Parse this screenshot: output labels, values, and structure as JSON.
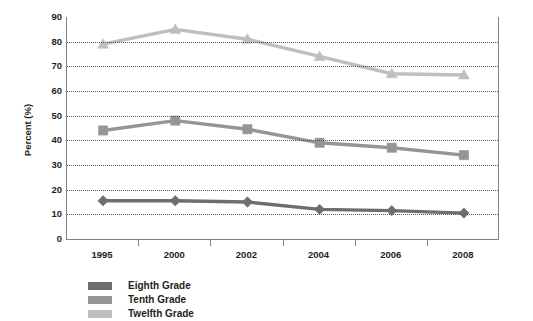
{
  "chart_data": {
    "type": "line",
    "title": "",
    "xlabel": "",
    "ylabel": "Percent (%)",
    "categories": [
      "1995",
      "2000",
      "2002",
      "2004",
      "2006",
      "2008"
    ],
    "ylim": [
      0,
      90
    ],
    "ytick_step": 10,
    "yticks": [
      "90",
      "80",
      "70",
      "60",
      "50",
      "40",
      "30",
      "20",
      "10",
      "0"
    ],
    "grid": true,
    "legend_position": "bottom-left",
    "series": [
      {
        "name": "Eighth Grade",
        "color": "#6d6e71",
        "marker": "diamond",
        "values": [
          15.5,
          15.5,
          15.0,
          12.0,
          11.5,
          10.5
        ]
      },
      {
        "name": "Tenth Grade",
        "color": "#939598",
        "marker": "square",
        "values": [
          44.0,
          48.0,
          44.5,
          39.0,
          37.0,
          34.0
        ]
      },
      {
        "name": "Twelfth Grade",
        "color": "#bcbec0",
        "marker": "triangle",
        "values": [
          79.0,
          85.0,
          81.0,
          74.0,
          67.0,
          66.5
        ]
      }
    ]
  },
  "axis": {
    "y_title": "Percent (%)"
  },
  "legend": {
    "items": [
      {
        "label": "Eighth Grade",
        "color": "#6d6e71"
      },
      {
        "label": "Tenth Grade",
        "color": "#939598"
      },
      {
        "label": "Twelfth Grade",
        "color": "#bcbec0"
      }
    ]
  }
}
